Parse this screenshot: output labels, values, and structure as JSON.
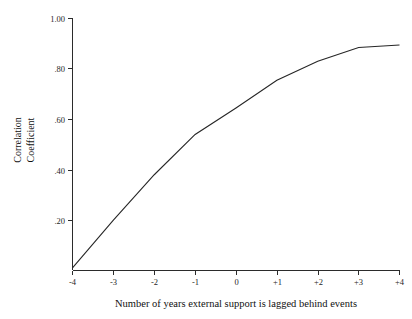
{
  "chart_data": {
    "type": "line",
    "title": "",
    "subtitle": "",
    "xlabel": "Number of years external support is lagged behind events",
    "ylabel": "Correlation Coefficient",
    "ylabel_lines": [
      "Correlation",
      "Coefficient"
    ],
    "x": [
      -4,
      -3,
      -2,
      -1,
      0,
      1,
      2,
      3,
      4
    ],
    "xtick_labels": [
      "-4",
      "-3",
      "-2",
      "-1",
      "0",
      "+1",
      "+2",
      "+3",
      "+4"
    ],
    "ytick_labels": [
      "1.00",
      ".80",
      ".60",
      ".40",
      ".20"
    ],
    "ytick_values": [
      1.0,
      0.8,
      0.6,
      0.4,
      0.2
    ],
    "series": [
      {
        "name": "correlation",
        "values": [
          0.01,
          0.2,
          0.38,
          0.54,
          0.645,
          0.755,
          0.83,
          0.885,
          0.895
        ]
      }
    ],
    "xlim": [
      -4,
      4
    ],
    "ylim": [
      0.0,
      1.0
    ],
    "grid": false,
    "legend": false,
    "legend_position": "none",
    "line_color": "#262626",
    "axis_color": "#2b2b2b",
    "background_color": "#ffffff"
  },
  "figure": {
    "axis_label_x": "Number of years external support is lagged behind events",
    "axis_label_y_line1": "Correlation",
    "axis_label_y_line2": "Coefficient",
    "ytick_0": "1.00",
    "ytick_1": ".80",
    "ytick_2": ".60",
    "ytick_3": ".40",
    "ytick_4": ".20",
    "xtick_0": "-4",
    "xtick_1": "-3",
    "xtick_2": "-2",
    "xtick_3": "-1",
    "xtick_4": "0",
    "xtick_5": "+1",
    "xtick_6": "+2",
    "xtick_7": "+3",
    "xtick_8": "+4"
  }
}
